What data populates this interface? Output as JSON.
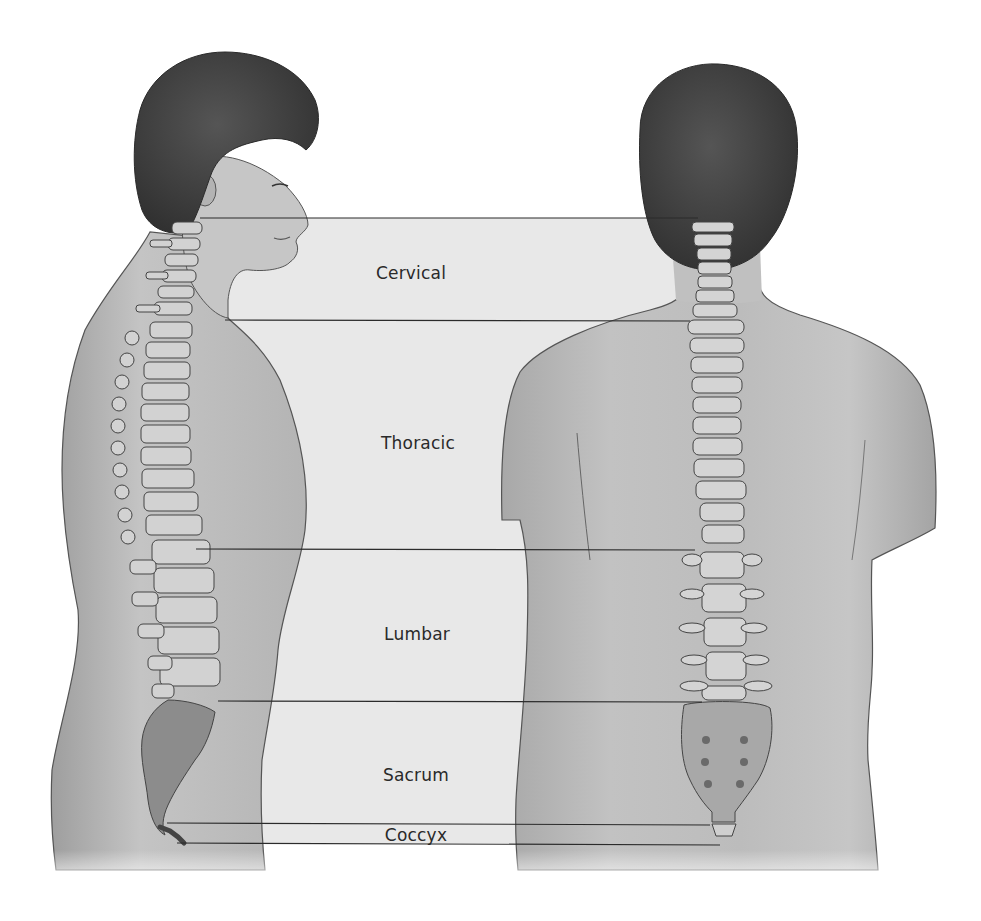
{
  "figure": {
    "views": [
      {
        "name": "lateral-view",
        "description": "Side view of male figure with spine"
      },
      {
        "name": "posterior-view",
        "description": "Back view of male figure with spine"
      }
    ],
    "regions": [
      {
        "label": "Cervical",
        "top_y": 218,
        "bottom_y": 320,
        "label_x": 411,
        "label_y": 273
      },
      {
        "label": "Thoracic",
        "top_y": 320,
        "bottom_y": 549,
        "label_x": 418,
        "label_y": 443
      },
      {
        "label": "Lumbar",
        "top_y": 549,
        "bottom_y": 701,
        "label_x": 417,
        "label_y": 634
      },
      {
        "label": "Sacrum",
        "top_y": 701,
        "bottom_y": 823,
        "label_x": 416,
        "label_y": 775
      },
      {
        "label": "Coccyx",
        "top_y": 823,
        "bottom_y": 843,
        "label_x": 416,
        "label_y": 836
      }
    ],
    "colors": {
      "background": "#ffffff",
      "band_fill": "#e9e9e9",
      "skin": "#bdbdbd",
      "skin_shadow": "#9a9a9a",
      "hair": "#3f3f3f",
      "bone": "#d6d6d6",
      "bone_outline": "#4a4a4a",
      "sacrum": "#8f8f8f",
      "line": "#2b2b2b",
      "label": "#2a2a2a"
    }
  }
}
